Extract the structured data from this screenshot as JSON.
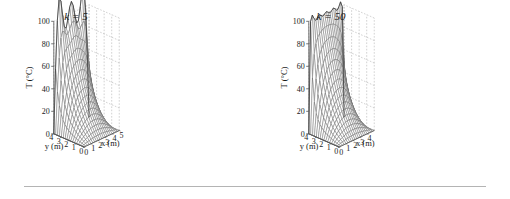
{
  "figure": {
    "background": "#ffffff",
    "axis_color": "#555555",
    "grid_color": "#999999",
    "mesh_color": "#666666",
    "surface_color": "#ffffff",
    "rule_color": "#b4b4b4",
    "has_bottom_rule": true
  },
  "panels": [
    {
      "id": "k5",
      "title": "k = 5",
      "title_k_symbol": "k",
      "title_k_value": 5,
      "x_extends_to_5_label": true
    },
    {
      "id": "k50",
      "title": "k = 50",
      "title_k_symbol": "k",
      "title_k_value": 50,
      "x_extends_to_5_label": false
    }
  ],
  "chart_data": [
    {
      "type": "surface",
      "id": "k5",
      "title": "k = 5",
      "zlabel": "T (°C)",
      "xlabel": "x (m)",
      "ylabel": "y (m)",
      "xlim": [
        0,
        5
      ],
      "ylim": [
        0,
        4
      ],
      "zlim": [
        0,
        100
      ],
      "xticks": [
        0,
        1,
        2,
        3,
        4,
        5
      ],
      "xticklabels": [
        "0",
        "1",
        "2",
        "3",
        "4",
        "5"
      ],
      "yticks": [
        0,
        1,
        2,
        3,
        4
      ],
      "yticklabels": [
        "0",
        "1",
        "2",
        "3",
        "4"
      ],
      "zticks": [
        0,
        20,
        40,
        60,
        80,
        100
      ],
      "zticklabels": [
        "0",
        "20",
        "40",
        "60",
        "80",
        "100"
      ],
      "grid": true,
      "grid_style": "dashed",
      "legend": "none",
      "mesh_nx": 21,
      "mesh_ny": 17,
      "description": "Fourier-series solution of steady 2D heat conduction truncated at k = 5 terms; hot edge at y = 4 shows Gibbs oscillations ringing between roughly 75 and 110 degrees C, decaying to 0 across the plate.",
      "hot_edge_value": 100,
      "hot_edge_oscillation_min": 75,
      "hot_edge_oscillation_max": 112,
      "ringing": true,
      "edge_profile_y4": [
        8,
        95,
        80,
        96,
        83,
        90,
        85,
        92,
        86,
        91,
        87,
        92,
        88,
        93,
        90,
        95,
        92,
        99,
        95,
        104,
        112
      ],
      "x_profile_at_y0": [
        0,
        0,
        0,
        0,
        0,
        0,
        0,
        0,
        0,
        0,
        0,
        0,
        0,
        0,
        0,
        0,
        0,
        0,
        0,
        0,
        0
      ]
    },
    {
      "type": "surface",
      "id": "k50",
      "title": "k = 50",
      "zlabel": "T (°C)",
      "xlabel": "x (m)",
      "ylabel": "y (m)",
      "xlim": [
        0,
        5
      ],
      "ylim": [
        0,
        4
      ],
      "zlim": [
        0,
        100
      ],
      "xticks": [
        0,
        1,
        2,
        3,
        4,
        5
      ],
      "xticklabels": [
        "0",
        "1",
        "2",
        "3",
        "4",
        "5"
      ],
      "yticks": [
        0,
        1,
        2,
        3,
        4
      ],
      "yticklabels": [
        "0",
        "1",
        "2",
        "3",
        "4"
      ],
      "zticks": [
        0,
        20,
        40,
        60,
        80,
        100
      ],
      "zticklabels": [
        "0",
        "20",
        "40",
        "60",
        "80",
        "100"
      ],
      "grid": true,
      "grid_style": "dashed",
      "legend": "none",
      "mesh_nx": 21,
      "mesh_ny": 17,
      "description": "Same Fourier-series solution truncated at k = 50 terms; hot edge at y = 4 is smooth and flat near 80 to 100 degrees C with no ringing, decaying smoothly to 0.",
      "hot_edge_value": 100,
      "hot_edge_oscillation_min": 80,
      "hot_edge_oscillation_max": 100,
      "ringing": false,
      "edge_profile_y4": [
        6,
        82,
        82,
        82,
        83,
        83,
        83,
        84,
        84,
        85,
        85,
        86,
        87,
        88,
        89,
        90,
        92,
        94,
        96,
        99,
        100
      ],
      "x_profile_at_y0": [
        0,
        0,
        0,
        0,
        0,
        0,
        0,
        0,
        0,
        0,
        0,
        0,
        0,
        0,
        0,
        0,
        0,
        0,
        0,
        0,
        0
      ]
    }
  ],
  "labels": {
    "zaxis": "T (°C)",
    "xaxis": "x (m)",
    "yaxis": "y (m)",
    "x_ticks": [
      "0",
      "1",
      "2",
      "3",
      "4",
      "5"
    ],
    "y_ticks": [
      "0",
      "1",
      "2",
      "3",
      "4"
    ],
    "z_ticks": [
      "0",
      "20",
      "40",
      "60",
      "80",
      "100"
    ]
  }
}
